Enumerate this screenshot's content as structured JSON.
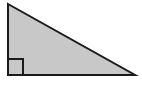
{
  "figure": {
    "name": "right-triangle",
    "canvas": {
      "width": 142,
      "height": 89,
      "background_color": "#ffffff"
    },
    "shape": {
      "type": "triangle",
      "fill_color": "#c8c8c8",
      "stroke_color": "#1a1a1a",
      "stroke_width": 2,
      "vertices": [
        {
          "name": "top-left-apex",
          "x": 8,
          "y": 4
        },
        {
          "name": "bottom-right",
          "x": 135,
          "y": 75
        },
        {
          "name": "bottom-left-right-angle",
          "x": 8,
          "y": 75
        }
      ],
      "points_attr": "8,4 135,75 8,75"
    },
    "right_angle_marker": {
      "name": "right-angle-square",
      "at_vertex": "bottom-left-right-angle",
      "size": 15,
      "stroke_color": "#1a1a1a",
      "stroke_width": 1.6,
      "points_attr": "8,59 23,59 23,75"
    }
  }
}
